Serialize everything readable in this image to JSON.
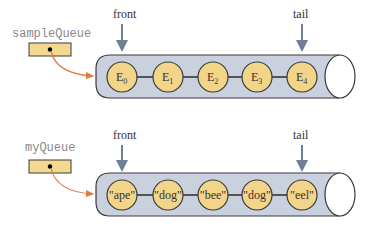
{
  "colors": {
    "tube": "#c9d1de",
    "tube_stroke": "#3a3a3a",
    "node_fill": "#f3d58a",
    "var_box": "#f3d98f",
    "pointer_arrow": "#e07a45",
    "marker_arrow": "#6e7f96"
  },
  "queues": [
    {
      "name": "sampleQueue",
      "front_label": "front",
      "tail_label": "tail",
      "elements": [
        {
          "base": "E",
          "sub": "0"
        },
        {
          "base": "E",
          "sub": "1"
        },
        {
          "base": "E",
          "sub": "2"
        },
        {
          "base": "E",
          "sub": "3"
        },
        {
          "base": "E",
          "sub": "4"
        }
      ]
    },
    {
      "name": "myQueue",
      "front_label": "front",
      "tail_label": "tail",
      "elements": [
        {
          "base": "\"ape\"",
          "sub": ""
        },
        {
          "base": "\"dog\"",
          "sub": ""
        },
        {
          "base": "\"bee\"",
          "sub": ""
        },
        {
          "base": "\"dog\"",
          "sub": ""
        },
        {
          "base": "\"eel\"",
          "sub": ""
        }
      ]
    }
  ]
}
